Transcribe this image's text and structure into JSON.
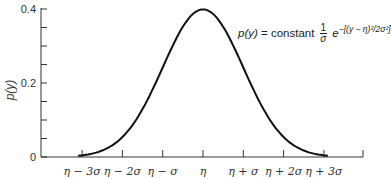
{
  "chart_data": {
    "type": "line",
    "title": "",
    "xlabel": "",
    "ylabel": "p(y)",
    "ylim": [
      0,
      0.4
    ],
    "yticks": [
      "0",
      "0.2",
      "0.4"
    ],
    "xticks": [
      "η − 3σ",
      "η − 2σ",
      "η − σ",
      "η",
      "η + σ",
      "η + 2σ",
      "η + 3σ"
    ],
    "series": [
      {
        "name": "normal density",
        "x_sigma": [
          -4,
          -3,
          -2,
          -1,
          0,
          1,
          2,
          3,
          4
        ],
        "values": [
          0.0001,
          0.0044,
          0.054,
          0.242,
          0.399,
          0.242,
          0.054,
          0.0044,
          0.0001
        ]
      }
    ],
    "annotation": {
      "lhs": "p(y)",
      "eq": " = constant ",
      "frac_num": "1",
      "frac_den": "σ",
      "exp_base": "e",
      "exponent": "−[(y − η)²/2σ²]"
    },
    "grid": false,
    "legend": "none"
  }
}
